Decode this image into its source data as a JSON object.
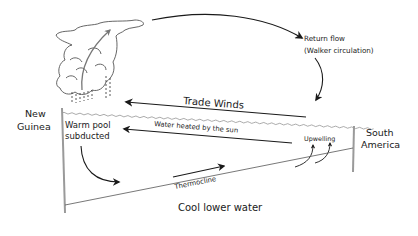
{
  "diagram": {
    "labels": {
      "return_flow_line1": "Return flow",
      "return_flow_line2": "(Walker circulation)",
      "trade_winds": "Trade Winds",
      "new_guinea_line1": "New",
      "new_guinea_line2": "Guinea",
      "warm_pool_line1": "Warm pool",
      "warm_pool_line2": "subducted",
      "water_heated": "Water heated by the sun",
      "upwelling": "Upwelling",
      "south_america_line1": "South",
      "south_america_line2": "America",
      "thermocline": "Thermocline",
      "cool_lower_water": "Cool lower water"
    },
    "icons": {
      "cloud": "storm-cloud-icon",
      "rain": "rain-drops-icon"
    },
    "colors": {
      "ink": "#1a1a1a",
      "wall": "#9a9a9a",
      "cloud_stroke": "#555555",
      "surface": "#8a8a8a"
    }
  }
}
